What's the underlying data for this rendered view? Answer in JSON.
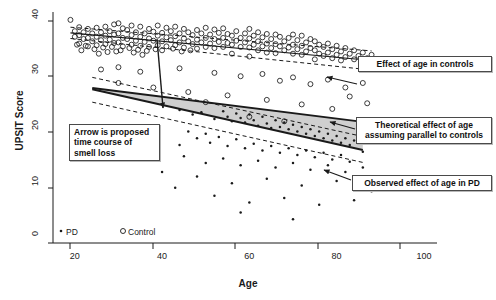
{
  "chart_data": {
    "type": "scatter",
    "title": "",
    "xlabel": "Age",
    "ylabel": "UPSIT Score",
    "xlim": [
      15,
      103
    ],
    "ylim": [
      0,
      41
    ],
    "xticks": [
      20,
      40,
      60,
      80,
      100
    ],
    "yticks": [
      0,
      10,
      20,
      30,
      40
    ],
    "grid": false,
    "legend_position": "bottom-left",
    "legend": [
      {
        "key": "pd",
        "label": "PD",
        "marker": "filled-dot"
      },
      {
        "key": "control",
        "label": "Control",
        "marker": "open-circle"
      }
    ],
    "series": [
      {
        "name": "Control",
        "marker": "open-circle",
        "points": [
          [
            19,
            39.6
          ],
          [
            20,
            37.6
          ],
          [
            20,
            36.6
          ],
          [
            20.5,
            35.2
          ],
          [
            21,
            38.3
          ],
          [
            21,
            36.9
          ],
          [
            21,
            35.4
          ],
          [
            21.5,
            34.2
          ],
          [
            22,
            37.4
          ],
          [
            22,
            36.2
          ],
          [
            22.5,
            35.0
          ],
          [
            23,
            38.0
          ],
          [
            23,
            36.4
          ],
          [
            23,
            34.9
          ],
          [
            24,
            37.2
          ],
          [
            24,
            35.8
          ],
          [
            24.5,
            34.4
          ],
          [
            25,
            38.2
          ],
          [
            25,
            36.6
          ],
          [
            25,
            35.1
          ],
          [
            25.5,
            33.6
          ],
          [
            26,
            37.4
          ],
          [
            26,
            36.0
          ],
          [
            26.5,
            34.7
          ],
          [
            27,
            38.4
          ],
          [
            27,
            36.8
          ],
          [
            27,
            35.3
          ],
          [
            27.5,
            33.9
          ],
          [
            28,
            37.6
          ],
          [
            28,
            36.1
          ],
          [
            28.5,
            34.8
          ],
          [
            29,
            38.8
          ],
          [
            29,
            37.0
          ],
          [
            29,
            35.5
          ],
          [
            29.5,
            34.0
          ],
          [
            30,
            39.0
          ],
          [
            30,
            37.2
          ],
          [
            30,
            35.6
          ],
          [
            30.5,
            34.2
          ],
          [
            31,
            38.1
          ],
          [
            31,
            36.4
          ],
          [
            31,
            34.9
          ],
          [
            32,
            37.8
          ],
          [
            32,
            36.2
          ],
          [
            32.5,
            34.6
          ],
          [
            33,
            38.6
          ],
          [
            33,
            36.9
          ],
          [
            33,
            35.2
          ],
          [
            33.5,
            33.8
          ],
          [
            34,
            37.4
          ],
          [
            34,
            35.9
          ],
          [
            34.5,
            34.3
          ],
          [
            35,
            38.4
          ],
          [
            35,
            36.6
          ],
          [
            35,
            35.0
          ],
          [
            35.5,
            33.4
          ],
          [
            36,
            37.2
          ],
          [
            36,
            35.7
          ],
          [
            36.5,
            34.1
          ],
          [
            37,
            38.0
          ],
          [
            37,
            36.3
          ],
          [
            37,
            34.8
          ],
          [
            38,
            37.5
          ],
          [
            38,
            35.9
          ],
          [
            38.5,
            34.4
          ],
          [
            39,
            38.6
          ],
          [
            39,
            36.8
          ],
          [
            39,
            35.1
          ],
          [
            40,
            37.3
          ],
          [
            40,
            35.8
          ],
          [
            40,
            34.2
          ],
          [
            41,
            38.2
          ],
          [
            41,
            36.5
          ],
          [
            41,
            34.9
          ],
          [
            42,
            37.6
          ],
          [
            42,
            36.0
          ],
          [
            42.5,
            34.5
          ],
          [
            43,
            38.4
          ],
          [
            43,
            36.7
          ],
          [
            43,
            35.1
          ],
          [
            44,
            37.2
          ],
          [
            44,
            35.6
          ],
          [
            44.5,
            34.0
          ],
          [
            45,
            38.0
          ],
          [
            45,
            36.3
          ],
          [
            45,
            34.7
          ],
          [
            46,
            37.4
          ],
          [
            46,
            35.8
          ],
          [
            46.5,
            34.2
          ],
          [
            47,
            36.9
          ],
          [
            47,
            35.3
          ],
          [
            48,
            37.8
          ],
          [
            48,
            36.1
          ],
          [
            48,
            34.5
          ],
          [
            49,
            37.2
          ],
          [
            49,
            35.6
          ],
          [
            50,
            38.2
          ],
          [
            50,
            36.4
          ],
          [
            50,
            34.8
          ],
          [
            51,
            37.0
          ],
          [
            51,
            35.4
          ],
          [
            52,
            37.9
          ],
          [
            52,
            36.2
          ],
          [
            52,
            34.6
          ],
          [
            53,
            37.3
          ],
          [
            53,
            35.7
          ],
          [
            54,
            38.1
          ],
          [
            54,
            36.4
          ],
          [
            54,
            34.8
          ],
          [
            55,
            37.1
          ],
          [
            55,
            35.5
          ],
          [
            56,
            36.8
          ],
          [
            56,
            35.2
          ],
          [
            56,
            33.6
          ],
          [
            57,
            37.6
          ],
          [
            57,
            35.9
          ],
          [
            58,
            36.4
          ],
          [
            58,
            34.8
          ],
          [
            59,
            37.2
          ],
          [
            59,
            35.6
          ],
          [
            60,
            38.0
          ],
          [
            60,
            36.3
          ],
          [
            60,
            34.7
          ],
          [
            60,
            33.1
          ],
          [
            61,
            36.8
          ],
          [
            61,
            35.2
          ],
          [
            62,
            37.4
          ],
          [
            62,
            35.8
          ],
          [
            62,
            34.2
          ],
          [
            63,
            36.5
          ],
          [
            63,
            34.9
          ],
          [
            64,
            37.1
          ],
          [
            64,
            35.4
          ],
          [
            64,
            33.8
          ],
          [
            65,
            36.2
          ],
          [
            65,
            34.6
          ],
          [
            66,
            37.0
          ],
          [
            66,
            35.3
          ],
          [
            66,
            33.7
          ],
          [
            67,
            36.6
          ],
          [
            67,
            34.9
          ],
          [
            68,
            35.8
          ],
          [
            68,
            34.2
          ],
          [
            69,
            36.4
          ],
          [
            69,
            34.7
          ],
          [
            70,
            37.0
          ],
          [
            70,
            35.2
          ],
          [
            70,
            33.6
          ],
          [
            71,
            36.0
          ],
          [
            71,
            34.4
          ],
          [
            72,
            36.8
          ],
          [
            72,
            35.0
          ],
          [
            72,
            33.4
          ],
          [
            73,
            35.6
          ],
          [
            73,
            34.0
          ],
          [
            74,
            36.2
          ],
          [
            74,
            34.6
          ],
          [
            75,
            35.8
          ],
          [
            75,
            34.2
          ],
          [
            75,
            32.6
          ],
          [
            76,
            35.2
          ],
          [
            76,
            33.6
          ],
          [
            77,
            34.8
          ],
          [
            77,
            33.2
          ],
          [
            78,
            35.4
          ],
          [
            78,
            33.8
          ],
          [
            79,
            34.4
          ],
          [
            79,
            32.8
          ],
          [
            80,
            35.0
          ],
          [
            80,
            33.4
          ],
          [
            81,
            34.0
          ],
          [
            81,
            32.4
          ],
          [
            82,
            34.6
          ],
          [
            82,
            33.0
          ],
          [
            83,
            33.6
          ],
          [
            84,
            34.2
          ],
          [
            84,
            32.6
          ],
          [
            85,
            33.2
          ],
          [
            86,
            33.8
          ],
          [
            87,
            32.8
          ],
          [
            88,
            33.4
          ],
          [
            26,
            30.8
          ],
          [
            30,
            31.2
          ],
          [
            35,
            30.4
          ],
          [
            44,
            31.0
          ],
          [
            52,
            30.2
          ],
          [
            58,
            29.6
          ],
          [
            63,
            30.0
          ],
          [
            67,
            28.8
          ],
          [
            70,
            29.4
          ],
          [
            74,
            28.2
          ],
          [
            78,
            29.0
          ],
          [
            82,
            27.6
          ],
          [
            86,
            28.4
          ],
          [
            55,
            26.2
          ],
          [
            64,
            25.4
          ],
          [
            72,
            24.6
          ],
          [
            79,
            23.8
          ],
          [
            60,
            22.4
          ],
          [
            68,
            21.6
          ],
          [
            30,
            28.4
          ],
          [
            38,
            27.6
          ],
          [
            46,
            26.8
          ],
          [
            50,
            25.0
          ],
          [
            83,
            26.0
          ],
          [
            87,
            24.8
          ]
        ]
      },
      {
        "name": "PD",
        "marker": "filled-dot",
        "points": [
          [
            44,
            23.6
          ],
          [
            47,
            22.8
          ],
          [
            49,
            23.2
          ],
          [
            52,
            22.0
          ],
          [
            54,
            23.4
          ],
          [
            55,
            22.4
          ],
          [
            56,
            21.6
          ],
          [
            57,
            23.0
          ],
          [
            58,
            22.2
          ],
          [
            59,
            21.4
          ],
          [
            60,
            22.8
          ],
          [
            61,
            21.8
          ],
          [
            62,
            20.8
          ],
          [
            63,
            22.4
          ],
          [
            64,
            21.2
          ],
          [
            65,
            20.4
          ],
          [
            66,
            21.8
          ],
          [
            67,
            20.6
          ],
          [
            68,
            21.4
          ],
          [
            69,
            20.2
          ],
          [
            70,
            21.0
          ],
          [
            71,
            19.8
          ],
          [
            72,
            20.6
          ],
          [
            73,
            19.4
          ],
          [
            74,
            20.2
          ],
          [
            75,
            19.0
          ],
          [
            76,
            19.8
          ],
          [
            77,
            18.6
          ],
          [
            78,
            19.4
          ],
          [
            79,
            18.2
          ],
          [
            80,
            19.0
          ],
          [
            81,
            17.8
          ],
          [
            82,
            18.6
          ],
          [
            83,
            17.4
          ],
          [
            84,
            18.2
          ],
          [
            46,
            19.8
          ],
          [
            48,
            18.6
          ],
          [
            50,
            19.4
          ],
          [
            51,
            17.8
          ],
          [
            53,
            18.8
          ],
          [
            55,
            17.2
          ],
          [
            57,
            18.4
          ],
          [
            59,
            16.8
          ],
          [
            61,
            17.6
          ],
          [
            63,
            16.4
          ],
          [
            65,
            17.2
          ],
          [
            67,
            16.0
          ],
          [
            69,
            16.8
          ],
          [
            71,
            15.6
          ],
          [
            73,
            16.4
          ],
          [
            75,
            15.2
          ],
          [
            77,
            16.0
          ],
          [
            79,
            14.8
          ],
          [
            81,
            15.6
          ],
          [
            83,
            14.4
          ],
          [
            45,
            15.4
          ],
          [
            50,
            14.2
          ],
          [
            54,
            15.0
          ],
          [
            58,
            13.8
          ],
          [
            62,
            14.6
          ],
          [
            66,
            13.4
          ],
          [
            70,
            14.2
          ],
          [
            74,
            13.0
          ],
          [
            78,
            13.8
          ],
          [
            82,
            12.6
          ],
          [
            86,
            13.4
          ],
          [
            48,
            11.8
          ],
          [
            56,
            10.6
          ],
          [
            64,
            11.4
          ],
          [
            72,
            10.2
          ],
          [
            80,
            11.0
          ],
          [
            52,
            8.4
          ],
          [
            60,
            7.2
          ],
          [
            68,
            8.0
          ],
          [
            76,
            6.8
          ],
          [
            84,
            7.6
          ],
          [
            58,
            5.4
          ],
          [
            70,
            4.2
          ],
          [
            40,
            12.6
          ],
          [
            43,
            9.8
          ],
          [
            88,
            9.2
          ],
          [
            86,
            16.2
          ],
          [
            44,
            17.4
          ]
        ]
      }
    ],
    "fits": [
      {
        "name": "Effect of age in controls",
        "style": "solid",
        "x": [
          19,
          88
        ],
        "y": [
          37.3,
          32.4
        ],
        "ci_style": "dashed",
        "ci_upper": [
          38.3,
          34.1
        ],
        "ci_lower": [
          36.3,
          30.7
        ]
      },
      {
        "name": "Theoretical effect of age assuming parallel to controls",
        "style": "solid",
        "x": [
          24,
          86
        ],
        "y": [
          27.5,
          21.5
        ]
      },
      {
        "name": "Observed effect of age in PD",
        "style": "solid",
        "x": [
          24,
          86
        ],
        "y": [
          27.3,
          16.5
        ],
        "ci_style": "dashed",
        "ci_upper": [
          29.4,
          18.9
        ],
        "ci_lower": [
          25.0,
          14.3
        ]
      }
    ],
    "shaded_region": {
      "label": "gap between theoretical and observed PD decline",
      "color": "#bfbfbf",
      "opacity": 0.75
    },
    "time_course_arrow": {
      "label": "proposed time course of smell loss",
      "from": [
        40,
        34.4
      ],
      "to": [
        41,
        24.6
      ]
    }
  },
  "annotations": {
    "controls": {
      "text": "Effect of age in controls"
    },
    "theoretical": {
      "text": "Theoretical effect of age assuming parallel to controls"
    },
    "observed": {
      "text": "Observed effect of age in PD"
    },
    "arrow_note": {
      "text": "Arrow is proposed time course of smell loss"
    }
  },
  "axes": {
    "x_title": "Age",
    "y_title": "UPSIT Score",
    "x_tick_labels": [
      "20",
      "40",
      "60",
      "80",
      "100"
    ],
    "y_tick_labels": [
      "0",
      "10",
      "20",
      "30",
      "40"
    ]
  },
  "legend": {
    "pd_label": "PD",
    "control_label": "Control"
  },
  "colors": {
    "ink": "#1a1a1a",
    "shade": "#bfbfbf",
    "box_border": "#4a4a4a",
    "background": "#ffffff"
  }
}
